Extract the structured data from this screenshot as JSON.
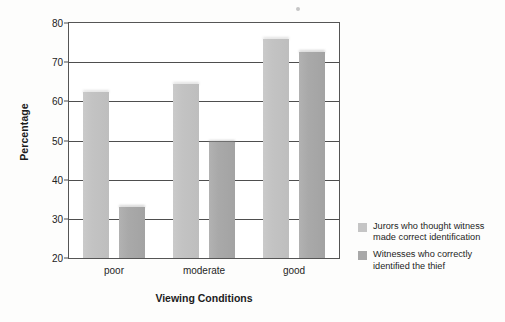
{
  "chart_data": {
    "type": "bar",
    "title": "",
    "subtitle": "",
    "xlabel": "Viewing Conditions",
    "ylabel": "Percentage",
    "categories": [
      "poor",
      "moderate",
      "good"
    ],
    "series": [
      {
        "name": "Jurors who thought witness made correct identification",
        "color": "#c5c5c5",
        "values": [
          62.5,
          64.5,
          76
        ]
      },
      {
        "name": "Witnesses who correctly identified the thief",
        "color": "#a8a8a8",
        "values": [
          33,
          49.5,
          72.5
        ]
      }
    ],
    "ylim": [
      20,
      80
    ],
    "yticks": [
      20,
      30,
      40,
      50,
      60,
      70,
      80
    ],
    "ytick_labels": [
      "20",
      "30",
      "40",
      "50",
      "60",
      "70",
      "80"
    ],
    "grid": "horizontal",
    "legend_position": "right"
  },
  "legend": {
    "entries": [
      {
        "swatch": "series-0-swatch",
        "line1": "Jurors who thought witness",
        "line2": "made correct identification"
      },
      {
        "swatch": "series-1-swatch",
        "line1": "Witnesses who correctly",
        "line2": "identified the thief"
      }
    ]
  },
  "axes": {
    "y_title": "Percentage",
    "x_title": "Viewing Conditions"
  }
}
